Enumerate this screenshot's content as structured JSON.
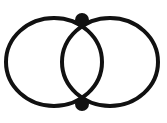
{
  "figure": {
    "name": "two-overlapping-circles-diagram",
    "background_color": "#ffffff",
    "stroke_color": "#111111",
    "vertex_color": "#111111"
  },
  "chart_data": {
    "type": "diagram",
    "title": "",
    "subtitle": "",
    "xlabel": "",
    "ylabel": "",
    "grid": false,
    "legend": null,
    "canvas": {
      "width": 167,
      "height": 123
    },
    "shapes": [
      {
        "id": "left-circle",
        "type": "circle",
        "cx": 54,
        "cy": 62,
        "rx": 48,
        "ry": 44,
        "stroke": "#111111",
        "stroke_width": 4,
        "fill": "none"
      },
      {
        "id": "right-circle",
        "type": "circle",
        "cx": 110,
        "cy": 62,
        "rx": 48,
        "ry": 44,
        "stroke": "#111111",
        "stroke_width": 4,
        "fill": "none"
      }
    ],
    "vertices": [
      {
        "id": "top-vertex",
        "label": "",
        "x": 82,
        "y": 20,
        "radius": 7,
        "fill": "#111111",
        "degree": 4
      },
      {
        "id": "bottom-vertex",
        "label": "",
        "x": 82,
        "y": 104,
        "radius": 7,
        "fill": "#111111",
        "degree": 4
      }
    ],
    "annotations": []
  },
  "caption": {
    "text": "",
    "visible": false,
    "note": "cut-off"
  }
}
